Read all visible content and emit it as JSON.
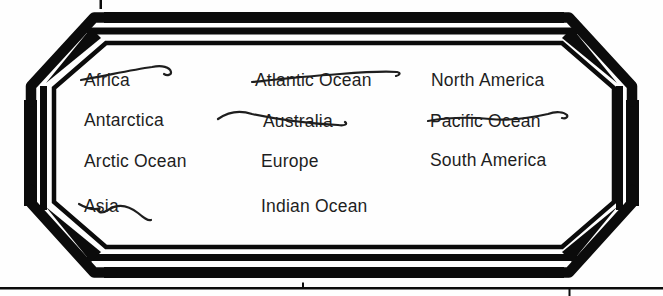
{
  "worksheet": {
    "description": "List of continents and oceans inside a decorative frame; several entries are crossed out",
    "items": [
      {
        "label": "Africa",
        "struck": true
      },
      {
        "label": "Antarctica",
        "struck": false
      },
      {
        "label": "Arctic Ocean",
        "struck": false
      },
      {
        "label": "Asia",
        "struck": true
      },
      {
        "label": "Atlantic Ocean",
        "struck": true
      },
      {
        "label": "Australia",
        "struck": true
      },
      {
        "label": "Europe",
        "struck": false
      },
      {
        "label": "Indian Ocean",
        "struck": false
      },
      {
        "label": "North America",
        "struck": false
      },
      {
        "label": "Pacific Ocean",
        "struck": true
      },
      {
        "label": "South America",
        "struck": false
      }
    ]
  },
  "colors": {
    "ink": "#1e1e1e",
    "frame": "#0b0b0b",
    "paper": "#fefefe"
  }
}
